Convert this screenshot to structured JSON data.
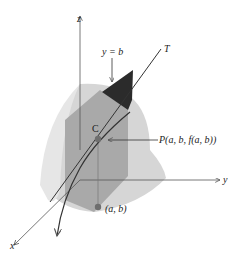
{
  "diagram": {
    "labels": {
      "z_axis": "z",
      "y_axis": "y",
      "x_axis": "x",
      "plane": "y = b",
      "tangent": "T",
      "curve": "C",
      "point_p": "P(a, b, f(a, b))",
      "point_ab": "(a, b)"
    },
    "colors": {
      "surface_back": "#d9d9d9",
      "surface_front": "#c4c4c4",
      "plane_lower": "#9a9a9a",
      "plane_upper": "#2b2b2b",
      "axis": "#555555",
      "curve": "#333333",
      "point": "#6e6e6e",
      "background": "#ffffff"
    }
  }
}
